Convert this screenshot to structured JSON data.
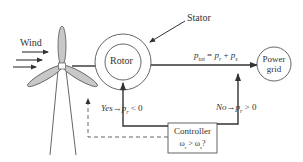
{
  "diagram": {
    "type": "wind-turbine DFIG power flow block diagram",
    "wind_label": "Wind",
    "rotor_label": "Rotor",
    "stator_label": "Stator",
    "power_grid_label_line1": "Power",
    "power_grid_label_line2": "grid",
    "ptot_equation": {
      "lhs": "p",
      "lhs_sub": "tot",
      "eq": " = ",
      "t1": "p",
      "t1_sub": "r",
      "plus": " + ",
      "t2": "p",
      "t2_sub": "s"
    },
    "yes_branch": {
      "label": "Yes",
      "arrow": "→",
      "var": "p",
      "var_sub": "r",
      "rel": " < 0"
    },
    "no_branch": {
      "label": "No",
      "arrow": "→",
      "var": "p",
      "var_sub": "r",
      "rel": " > 0"
    },
    "controller": {
      "title": "Controller",
      "cond_a": "ω",
      "cond_a_sub": "r",
      "cond_rel": " > ",
      "cond_b": "ω",
      "cond_b_sub": "s",
      "cond_q": "?"
    },
    "colors": {
      "line": "#333333",
      "blade_fill": "#c8c8c8",
      "background": "#ffffff"
    }
  }
}
